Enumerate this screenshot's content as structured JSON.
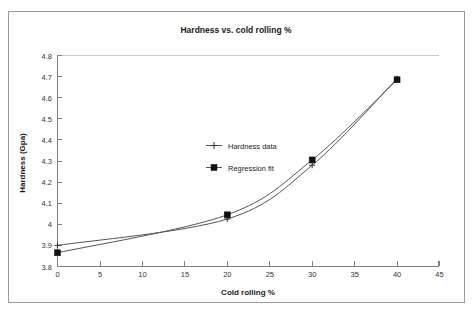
{
  "chart_data": {
    "type": "line",
    "title": "Hardness vs. cold rolling %",
    "xlabel": "Cold rolling %",
    "ylabel": "Hardness (Gpa)",
    "xlim": [
      0,
      45
    ],
    "ylim": [
      3.8,
      4.8
    ],
    "xticks": [
      "0",
      "5",
      "10",
      "15",
      "20",
      "25",
      "30",
      "35",
      "40",
      "45"
    ],
    "yticks": [
      "3.8",
      "3.9",
      "4",
      "4.1",
      "4.2",
      "4.3",
      "4.4",
      "4.5",
      "4.6",
      "4.7",
      "4.8"
    ],
    "grid": "top-border-only",
    "legend_position": "inside-center-left",
    "x": [
      0,
      20,
      30,
      40
    ],
    "series": [
      {
        "name": "Hardness data",
        "marker": "cross",
        "values": [
          3.9,
          4.025,
          4.28,
          4.69
        ]
      },
      {
        "name": "Regression fit",
        "marker": "square",
        "values": [
          3.865,
          4.045,
          4.305,
          4.685
        ]
      }
    ]
  },
  "legend": {
    "entries": [
      {
        "label": "Hardness data"
      },
      {
        "label": "Regression fit"
      }
    ]
  },
  "colors": {
    "series_line": "#555555",
    "marker": "#111111",
    "axis": "#808080",
    "frame": "#9a9a9a",
    "background": "#ffffff"
  }
}
